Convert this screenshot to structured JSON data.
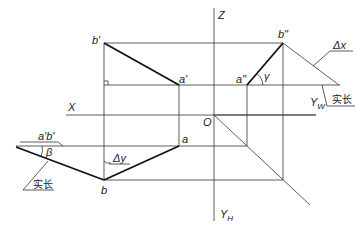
{
  "labels": {
    "z_axis": "Z",
    "x_axis": "X",
    "yw_axis": "Y",
    "yw_sub": "W",
    "yh_axis": "Y",
    "yh_sub": "H",
    "origin": "O",
    "b_prime": "b'",
    "a_prime": "a'",
    "a_dprime": "a\"",
    "b_dprime": "b\"",
    "a_plain": "a",
    "b_plain": "b",
    "ab_prime": "a'b'",
    "gamma": "γ",
    "beta": "β",
    "delta_x": "Δx",
    "delta_y": "Δy",
    "true_length_w": "实长",
    "true_length_h": "实长"
  }
}
